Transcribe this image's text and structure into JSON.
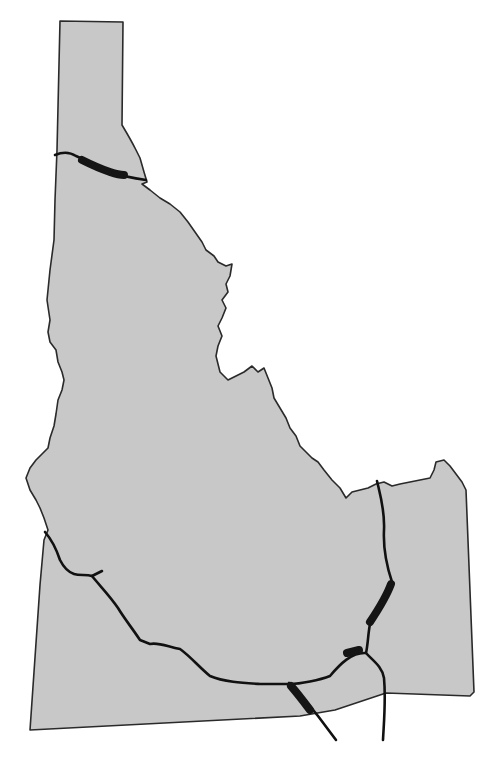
{
  "map": {
    "subject": "Idaho state outline",
    "colors": {
      "land": "#c8c8c8",
      "border": "#2a2a2a",
      "route": "#111111",
      "highlight_segment": "#151515",
      "background": "#ffffff"
    },
    "features": [
      {
        "type": "route",
        "name": "northern-panhandle-route"
      },
      {
        "type": "route",
        "name": "southwest-route"
      },
      {
        "type": "route",
        "name": "southern-east-west-route"
      },
      {
        "type": "route",
        "name": "eastern-north-south-route"
      },
      {
        "type": "route",
        "name": "southeast-diagonal-route"
      },
      {
        "type": "highlight_segment",
        "name": "panhandle-segment"
      },
      {
        "type": "highlight_segment",
        "name": "eastern-segment"
      },
      {
        "type": "highlight_segment",
        "name": "junction-segment"
      },
      {
        "type": "highlight_segment",
        "name": "southern-segment"
      }
    ]
  }
}
